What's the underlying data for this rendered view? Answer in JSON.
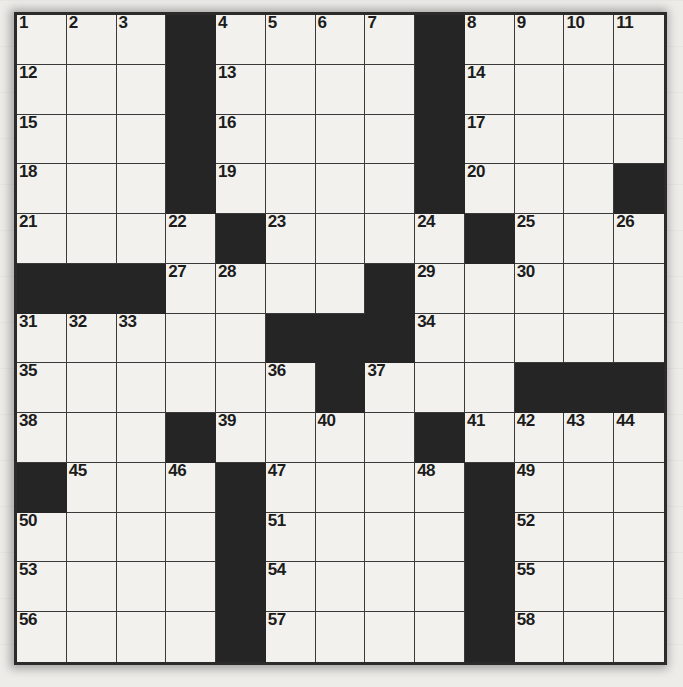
{
  "puzzle": {
    "type": "crossword-grid",
    "rows": 13,
    "cols": 13,
    "colors": {
      "paper": "#edece8",
      "cell_fill": "#f2f1ed",
      "block_fill": "#252525",
      "grid_line": "#3a3a3a",
      "number_text": "#1c1c1c"
    },
    "black_squares": [
      [
        0,
        3
      ],
      [
        0,
        8
      ],
      [
        1,
        3
      ],
      [
        1,
        8
      ],
      [
        2,
        3
      ],
      [
        2,
        8
      ],
      [
        3,
        3
      ],
      [
        3,
        8
      ],
      [
        3,
        12
      ],
      [
        4,
        4
      ],
      [
        4,
        9
      ],
      [
        5,
        0
      ],
      [
        5,
        1
      ],
      [
        5,
        2
      ],
      [
        5,
        7
      ],
      [
        6,
        5
      ],
      [
        6,
        6
      ],
      [
        6,
        7
      ],
      [
        7,
        6
      ],
      [
        7,
        10
      ],
      [
        7,
        11
      ],
      [
        7,
        12
      ],
      [
        8,
        3
      ],
      [
        8,
        8
      ],
      [
        9,
        0
      ],
      [
        9,
        4
      ],
      [
        9,
        9
      ],
      [
        10,
        4
      ],
      [
        10,
        9
      ],
      [
        11,
        4
      ],
      [
        11,
        9
      ],
      [
        12,
        4
      ],
      [
        12,
        9
      ]
    ],
    "numbers": [
      {
        "row": 0,
        "col": 0,
        "n": "1"
      },
      {
        "row": 0,
        "col": 1,
        "n": "2"
      },
      {
        "row": 0,
        "col": 2,
        "n": "3"
      },
      {
        "row": 0,
        "col": 4,
        "n": "4"
      },
      {
        "row": 0,
        "col": 5,
        "n": "5"
      },
      {
        "row": 0,
        "col": 6,
        "n": "6"
      },
      {
        "row": 0,
        "col": 7,
        "n": "7"
      },
      {
        "row": 0,
        "col": 9,
        "n": "8"
      },
      {
        "row": 0,
        "col": 10,
        "n": "9"
      },
      {
        "row": 0,
        "col": 11,
        "n": "10"
      },
      {
        "row": 0,
        "col": 12,
        "n": "11"
      },
      {
        "row": 1,
        "col": 0,
        "n": "12"
      },
      {
        "row": 1,
        "col": 4,
        "n": "13"
      },
      {
        "row": 1,
        "col": 9,
        "n": "14"
      },
      {
        "row": 2,
        "col": 0,
        "n": "15"
      },
      {
        "row": 2,
        "col": 4,
        "n": "16"
      },
      {
        "row": 2,
        "col": 9,
        "n": "17"
      },
      {
        "row": 3,
        "col": 0,
        "n": "18"
      },
      {
        "row": 3,
        "col": 4,
        "n": "19"
      },
      {
        "row": 3,
        "col": 9,
        "n": "20"
      },
      {
        "row": 4,
        "col": 0,
        "n": "21"
      },
      {
        "row": 4,
        "col": 3,
        "n": "22"
      },
      {
        "row": 4,
        "col": 5,
        "n": "23"
      },
      {
        "row": 4,
        "col": 8,
        "n": "24"
      },
      {
        "row": 4,
        "col": 10,
        "n": "25"
      },
      {
        "row": 4,
        "col": 12,
        "n": "26"
      },
      {
        "row": 5,
        "col": 3,
        "n": "27"
      },
      {
        "row": 5,
        "col": 4,
        "n": "28"
      },
      {
        "row": 5,
        "col": 8,
        "n": "29"
      },
      {
        "row": 5,
        "col": 10,
        "n": "30"
      },
      {
        "row": 6,
        "col": 0,
        "n": "31"
      },
      {
        "row": 6,
        "col": 1,
        "n": "32"
      },
      {
        "row": 6,
        "col": 2,
        "n": "33"
      },
      {
        "row": 6,
        "col": 8,
        "n": "34"
      },
      {
        "row": 7,
        "col": 0,
        "n": "35"
      },
      {
        "row": 7,
        "col": 5,
        "n": "36"
      },
      {
        "row": 7,
        "col": 7,
        "n": "37"
      },
      {
        "row": 8,
        "col": 0,
        "n": "38"
      },
      {
        "row": 8,
        "col": 4,
        "n": "39"
      },
      {
        "row": 8,
        "col": 6,
        "n": "40"
      },
      {
        "row": 8,
        "col": 9,
        "n": "41"
      },
      {
        "row": 8,
        "col": 10,
        "n": "42"
      },
      {
        "row": 8,
        "col": 11,
        "n": "43"
      },
      {
        "row": 8,
        "col": 12,
        "n": "44"
      },
      {
        "row": 9,
        "col": 1,
        "n": "45"
      },
      {
        "row": 9,
        "col": 3,
        "n": "46"
      },
      {
        "row": 9,
        "col": 5,
        "n": "47"
      },
      {
        "row": 9,
        "col": 8,
        "n": "48"
      },
      {
        "row": 9,
        "col": 10,
        "n": "49"
      },
      {
        "row": 10,
        "col": 0,
        "n": "50"
      },
      {
        "row": 10,
        "col": 5,
        "n": "51"
      },
      {
        "row": 10,
        "col": 10,
        "n": "52"
      },
      {
        "row": 11,
        "col": 0,
        "n": "53"
      },
      {
        "row": 11,
        "col": 5,
        "n": "54"
      },
      {
        "row": 11,
        "col": 10,
        "n": "55"
      },
      {
        "row": 12,
        "col": 0,
        "n": "56"
      },
      {
        "row": 12,
        "col": 5,
        "n": "57"
      },
      {
        "row": 12,
        "col": 10,
        "n": "58"
      }
    ]
  }
}
